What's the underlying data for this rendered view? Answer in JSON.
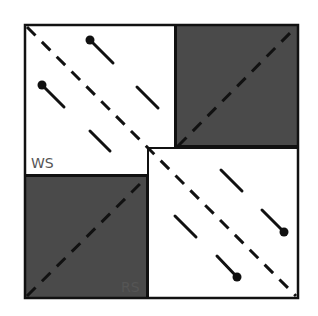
{
  "diagram": {
    "labels": {
      "ws": "WS",
      "rs": "RS"
    },
    "colors": {
      "shade": "#4a4a4a",
      "line": "#111111",
      "label": "#555555",
      "background": "#ffffff"
    },
    "regions": [
      {
        "name": "ws-region",
        "x": 25,
        "y": 25,
        "w": 150,
        "h": 150,
        "fill": "white"
      },
      {
        "name": "top-right-shaded",
        "x": 176,
        "y": 25,
        "w": 122,
        "h": 121,
        "fill": "shade"
      },
      {
        "name": "bottom-left-shaded",
        "x": 25,
        "y": 176,
        "w": 122,
        "h": 122,
        "fill": "shade"
      },
      {
        "name": "rs-region",
        "x": 148,
        "y": 148,
        "w": 150,
        "h": 150,
        "fill": "white"
      }
    ]
  }
}
